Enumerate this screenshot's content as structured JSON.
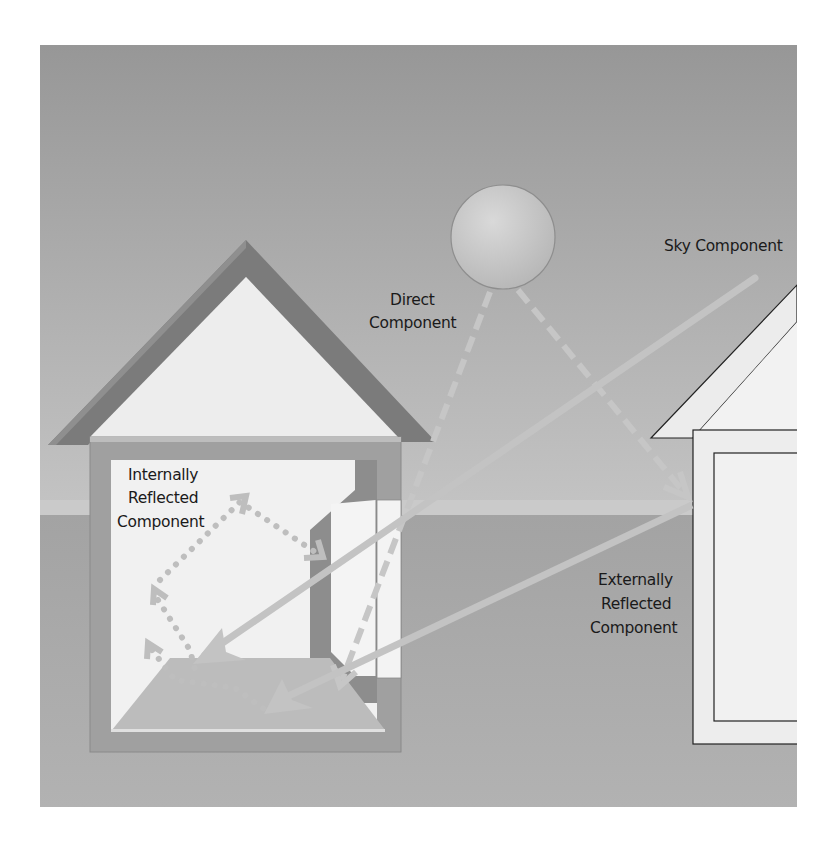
{
  "labels": {
    "sky": "Sky Component",
    "direct": [
      "Direct",
      "Component"
    ],
    "internal": [
      "Internally",
      "Reflected",
      "Component"
    ],
    "external": [
      "Externally",
      "Reflected",
      "Component"
    ]
  },
  "elements": {
    "sun": "sun",
    "left_house": "room with window",
    "right_house": "obstructing building"
  },
  "colors": {
    "sky_top": "#969696",
    "sky_horizon": "#c6c6c6",
    "ground": "#a9a9a9",
    "roof": "#7d7d7d",
    "wall": "#a2a2a2",
    "interior": "#f1f1f1",
    "floor": "#bdbdbd",
    "ray": "#c4c4c4",
    "label": "#1a1a1a"
  }
}
